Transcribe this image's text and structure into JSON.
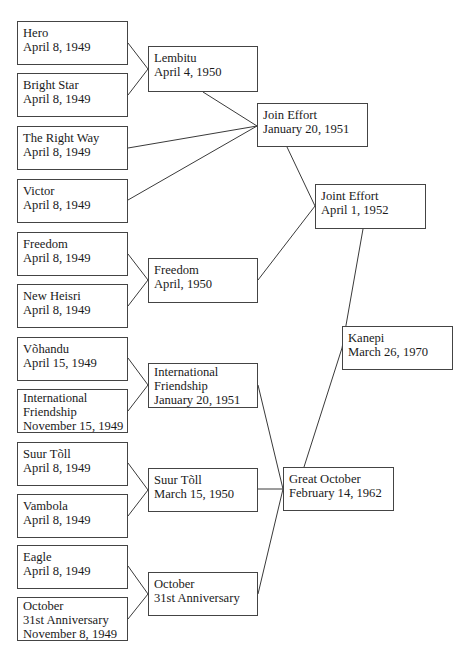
{
  "diagram": {
    "type": "lineage-tree",
    "nodes": [
      {
        "id": "hero",
        "lines": [
          "Hero",
          "April 8, 1949"
        ],
        "x": 17,
        "y": 21,
        "w": 111,
        "h": 44
      },
      {
        "id": "bright-star",
        "lines": [
          "Bright Star",
          "April 8, 1949"
        ],
        "x": 17,
        "y": 73,
        "w": 111,
        "h": 44
      },
      {
        "id": "the-right-way",
        "lines": [
          "The Right Way",
          "April 8, 1949"
        ],
        "x": 17,
        "y": 126,
        "w": 111,
        "h": 44
      },
      {
        "id": "victor",
        "lines": [
          "Victor",
          "April 8, 1949"
        ],
        "x": 17,
        "y": 179,
        "w": 111,
        "h": 44
      },
      {
        "id": "freedom-1949",
        "lines": [
          "Freedom",
          "April 8, 1949"
        ],
        "x": 17,
        "y": 232,
        "w": 111,
        "h": 44
      },
      {
        "id": "new-heisri",
        "lines": [
          "New Heisri",
          "April 8, 1949"
        ],
        "x": 17,
        "y": 284,
        "w": 111,
        "h": 44
      },
      {
        "id": "vohandu",
        "lines": [
          "Võhandu",
          "April 15, 1949"
        ],
        "x": 17,
        "y": 337,
        "w": 111,
        "h": 44
      },
      {
        "id": "intl-friendship-1949",
        "lines": [
          "International",
          "Friendship",
          "November 15, 1949"
        ],
        "x": 17,
        "y": 389,
        "w": 111,
        "h": 44
      },
      {
        "id": "suur-toll-1949",
        "lines": [
          "Suur Tõll",
          "April 8, 1949"
        ],
        "x": 17,
        "y": 442,
        "w": 111,
        "h": 44
      },
      {
        "id": "vambola",
        "lines": [
          "Vambola",
          "April 8, 1949"
        ],
        "x": 17,
        "y": 494,
        "w": 111,
        "h": 44
      },
      {
        "id": "eagle",
        "lines": [
          "Eagle",
          "April 8, 1949"
        ],
        "x": 17,
        "y": 545,
        "w": 111,
        "h": 44
      },
      {
        "id": "october-31st-1949",
        "lines": [
          "October",
          "31st Anniversary",
          "November 8, 1949"
        ],
        "x": 17,
        "y": 597,
        "w": 111,
        "h": 44
      },
      {
        "id": "lembitu",
        "lines": [
          "Lembitu",
          "April 4, 1950"
        ],
        "x": 148,
        "y": 46,
        "w": 110,
        "h": 46
      },
      {
        "id": "freedom-1950",
        "lines": [
          "Freedom",
          "April, 1950"
        ],
        "x": 148,
        "y": 258,
        "w": 110,
        "h": 45
      },
      {
        "id": "intl-friendship-1951",
        "lines": [
          "International",
          "Friendship",
          "January 20, 1951"
        ],
        "x": 148,
        "y": 363,
        "w": 110,
        "h": 45
      },
      {
        "id": "suur-toll-1950",
        "lines": [
          "Suur Tõll",
          "March 15, 1950"
        ],
        "x": 148,
        "y": 468,
        "w": 110,
        "h": 44
      },
      {
        "id": "october-31st",
        "lines": [
          "October",
          "31st Anniversary"
        ],
        "x": 148,
        "y": 572,
        "w": 110,
        "h": 44
      },
      {
        "id": "join-effort",
        "lines": [
          "Join Effort",
          "January 20, 1951"
        ],
        "x": 257,
        "y": 103,
        "w": 111,
        "h": 44
      },
      {
        "id": "joint-effort",
        "lines": [
          "Joint Effort",
          "April 1, 1952"
        ],
        "x": 315,
        "y": 184,
        "w": 111,
        "h": 45
      },
      {
        "id": "kanepi",
        "lines": [
          "Kanepi",
          "March 26, 1970"
        ],
        "x": 342,
        "y": 326,
        "w": 111,
        "h": 44
      },
      {
        "id": "great-october",
        "lines": [
          "Great October",
          "February 14, 1962"
        ],
        "x": 283,
        "y": 467,
        "w": 111,
        "h": 44
      }
    ],
    "edges": [
      {
        "from": "hero",
        "to": "lembitu",
        "x1": 128,
        "y1": 43,
        "x2": 148,
        "y2": 69
      },
      {
        "from": "bright-star",
        "to": "lembitu",
        "x1": 128,
        "y1": 95,
        "x2": 148,
        "y2": 69
      },
      {
        "from": "lembitu",
        "to": "join-effort",
        "x1": 203,
        "y1": 92,
        "x2": 257,
        "y2": 126
      },
      {
        "from": "the-right-way",
        "to": "join-effort",
        "x1": 128,
        "y1": 148,
        "x2": 257,
        "y2": 126
      },
      {
        "from": "victor",
        "to": "join-effort",
        "x1": 128,
        "y1": 200,
        "x2": 257,
        "y2": 126
      },
      {
        "from": "join-effort",
        "to": "joint-effort",
        "x1": 287,
        "y1": 147,
        "x2": 315,
        "y2": 206
      },
      {
        "from": "freedom-1949",
        "to": "freedom-1950",
        "x1": 128,
        "y1": 254,
        "x2": 148,
        "y2": 280
      },
      {
        "from": "new-heisri",
        "to": "freedom-1950",
        "x1": 128,
        "y1": 306,
        "x2": 148,
        "y2": 280
      },
      {
        "from": "freedom-1950",
        "to": "joint-effort",
        "x1": 258,
        "y1": 280,
        "x2": 315,
        "y2": 206
      },
      {
        "from": "joint-effort",
        "to": "kanepi",
        "x1": 363,
        "y1": 229,
        "x2": 342,
        "y2": 348
      },
      {
        "from": "vohandu",
        "to": "intl-friendship-1951",
        "x1": 128,
        "y1": 358,
        "x2": 148,
        "y2": 385
      },
      {
        "from": "intl-friendship-1949",
        "to": "intl-friendship-1951",
        "x1": 128,
        "y1": 411,
        "x2": 148,
        "y2": 385
      },
      {
        "from": "intl-friendship-1951",
        "to": "great-october",
        "x1": 258,
        "y1": 385,
        "x2": 283,
        "y2": 489
      },
      {
        "from": "suur-toll-1949",
        "to": "suur-toll-1950",
        "x1": 128,
        "y1": 463,
        "x2": 148,
        "y2": 490
      },
      {
        "from": "vambola",
        "to": "suur-toll-1950",
        "x1": 128,
        "y1": 516,
        "x2": 148,
        "y2": 490
      },
      {
        "from": "suur-toll-1950",
        "to": "great-october",
        "x1": 258,
        "y1": 489,
        "x2": 283,
        "y2": 489
      },
      {
        "from": "eagle",
        "to": "october-31st",
        "x1": 128,
        "y1": 566,
        "x2": 148,
        "y2": 594
      },
      {
        "from": "october-31st-1949",
        "to": "october-31st",
        "x1": 128,
        "y1": 619,
        "x2": 148,
        "y2": 594
      },
      {
        "from": "october-31st",
        "to": "great-october",
        "x1": 258,
        "y1": 594,
        "x2": 283,
        "y2": 489
      },
      {
        "from": "great-october",
        "to": "kanepi",
        "x1": 304,
        "y1": 467,
        "x2": 342,
        "y2": 348
      }
    ]
  }
}
